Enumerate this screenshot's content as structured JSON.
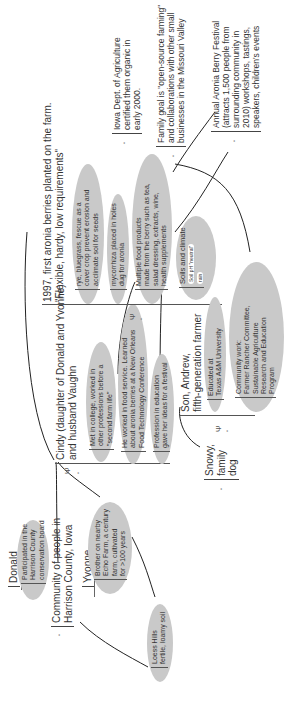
{
  "nodes": {
    "donald": {
      "title": "Donald",
      "items": [
        "Participated in the",
        "Harrison County",
        "conservation board"
      ]
    },
    "community": {
      "lines": [
        "Community of people in",
        "Harrison County, Iowa"
      ]
    },
    "yvonne": {
      "title": "Yvonne",
      "items": [
        "Brother on nearby",
        "Echo Farm, a century",
        "farm, cultivated",
        "for >100 years"
      ]
    },
    "loess": {
      "lines": [
        "Loess Hills",
        "fertile, loamy soil"
      ]
    },
    "cindy": {
      "title": [
        "Cindy (daughter of Donald and Yvonne)",
        "and husband Vaughn"
      ],
      "items": [
        [
          "Met in college, worked in",
          "other professions before a",
          "\"second farm life\""
        ],
        [
          "He worked in food service. Learned",
          "about aronia berries at a New Orleans",
          "Food Technology Conference"
        ],
        [
          "Profession in education",
          "gave her ideas for a festival"
        ]
      ]
    },
    "farm1997": {
      "title": [
        "1997, first aronia berries planted on the farm.",
        "\"Flexible, hardy, low requirements\""
      ],
      "items": [
        [
          "rye, bluegrass, fescue as a",
          "cover crop prevent erosion and",
          "acclimate soil for seeds"
        ],
        [
          "mycorrhiza placed in holes",
          "dug for aronia"
        ],
        [
          "Multiple food products",
          "made from the berry such as tea,",
          "salad dressing, extracts, wine,",
          "health supplements"
        ]
      ],
      "soils": {
        "title": "Soils and climate",
        "bullets": [
          "Soil pH \"neutral\"",
          "rain"
        ]
      }
    },
    "andrew": {
      "title": [
        "Son, Andrew,",
        "fifth-generation farmer"
      ],
      "items": [
        [
          "Educated at",
          "Texas A&M University"
        ],
        [
          "Community work:",
          "Farmer Rancher Committee,",
          "Sustainable Agriculture",
          "Research and Education",
          "Program"
        ]
      ]
    },
    "snowy": {
      "lines": [
        "Snowy,",
        "family",
        "dog"
      ]
    },
    "iowa_dept": {
      "lines": [
        "Iowa Dept. of Agriculture",
        "certified them organic in",
        "early 2000."
      ]
    },
    "family_goal": {
      "lines": [
        "Family goal is \"open-source farming\"",
        "and collaborations with other small",
        "businesses in the Missouri Valley"
      ]
    },
    "festival": {
      "lines": [
        "Annual Aronia Berry Festival",
        "(attracts 1,500 people from",
        "surrounding community in",
        "2010) workshops, tastings,",
        "speakers, children's events"
      ]
    }
  },
  "icons": {
    "bullet": "•",
    "expand": "Ψ"
  },
  "colors": {
    "ellipse": "#c9c9c9",
    "line": "#222222",
    "text": "#333333"
  }
}
